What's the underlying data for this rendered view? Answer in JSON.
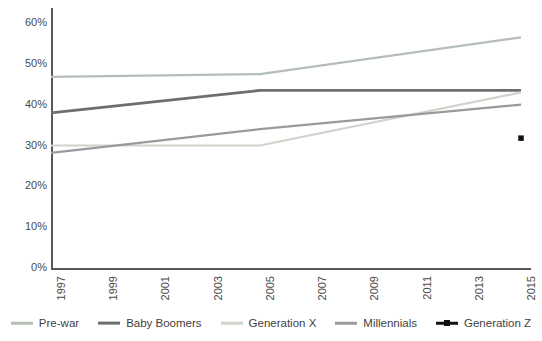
{
  "chart_data": {
    "type": "line",
    "title": "",
    "subtitle": "",
    "xlabel": "",
    "ylabel": "",
    "x": [
      1997,
      1999,
      2001,
      2003,
      2005,
      2007,
      2009,
      2011,
      2013,
      2015
    ],
    "xlim": [
      1997,
      2015
    ],
    "ylim": [
      0,
      60
    ],
    "y_tick_labels": [
      "0%",
      "10%",
      "20%",
      "30%",
      "40%",
      "50%",
      "60%"
    ],
    "y_tick_values": [
      0,
      10,
      20,
      30,
      40,
      50,
      60
    ],
    "x_tick_labels": [
      "1997",
      "1999",
      "2001",
      "2003",
      "2005",
      "2007",
      "2009",
      "2011",
      "2013",
      "2015"
    ],
    "grid": false,
    "legend_position": "bottom",
    "y_axis_unit": "percent",
    "series": [
      {
        "name": "Pre-war",
        "color": "#b5beb5",
        "width": 2.2,
        "marker": "none",
        "points": [
          {
            "x": 1997,
            "y": 46.8
          },
          {
            "x": 2005,
            "y": 47.5
          },
          {
            "x": 2015,
            "y": 56.5
          }
        ]
      },
      {
        "name": "Baby Boomers",
        "color": "#6e6e6e",
        "width": 2.8,
        "marker": "none",
        "points": [
          {
            "x": 1997,
            "y": 38.0
          },
          {
            "x": 2005,
            "y": 43.5
          },
          {
            "x": 2015,
            "y": 43.5
          }
        ]
      },
      {
        "name": "Generation X",
        "color": "#cfd4cb",
        "width": 2.2,
        "marker": "none",
        "points": [
          {
            "x": 1997,
            "y": 30.0
          },
          {
            "x": 2005,
            "y": 30.0
          },
          {
            "x": 2015,
            "y": 43.0
          }
        ]
      },
      {
        "name": "Millennials",
        "color": "#9a9a9a",
        "width": 2.2,
        "marker": "none",
        "points": [
          {
            "x": 1997,
            "y": 28.2
          },
          {
            "x": 2005,
            "y": 34.0
          },
          {
            "x": 2015,
            "y": 40.0
          }
        ]
      },
      {
        "name": "Generation Z",
        "color": "#111111",
        "width": 2.4,
        "marker": "square",
        "points": [
          {
            "x": 2015,
            "y": 31.8
          }
        ]
      }
    ]
  },
  "legend": {
    "items": [
      {
        "label": "Pre-war",
        "color": "#b5beb5",
        "marker": "line"
      },
      {
        "label": "Baby Boomers",
        "color": "#6e6e6e",
        "marker": "line"
      },
      {
        "label": "Generation X",
        "color": "#cfd4cb",
        "marker": "line"
      },
      {
        "label": "Millennials",
        "color": "#9a9a9a",
        "marker": "line"
      },
      {
        "label": "Generation Z",
        "color": "#111111",
        "marker": "line-dot"
      }
    ]
  },
  "axes": {
    "axis_color": "#595959",
    "tick_text_color": "#4a4a4a"
  }
}
